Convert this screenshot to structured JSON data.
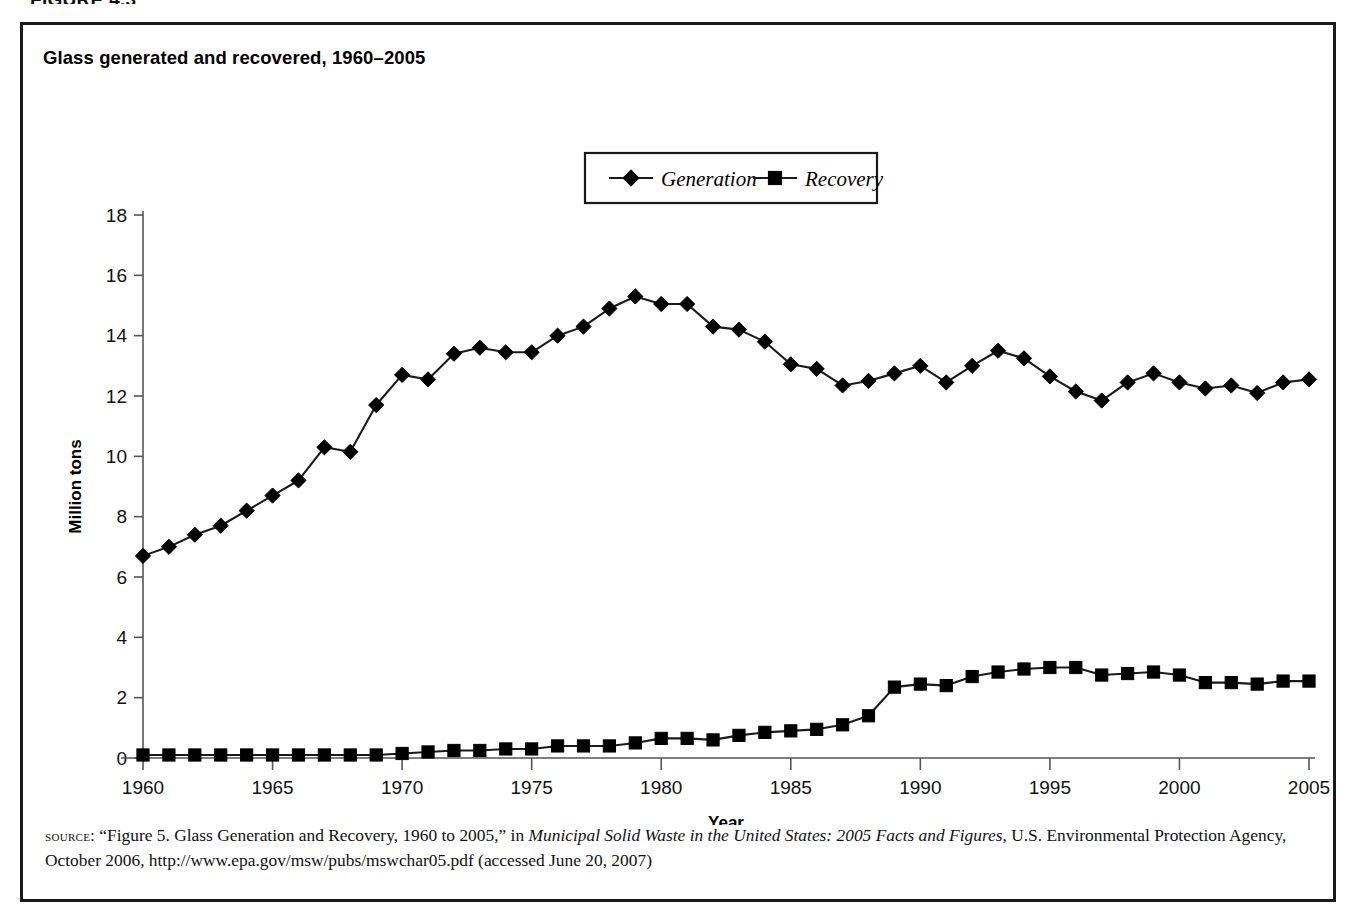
{
  "figure_number": "FIGURE 4.3",
  "chart_title": "Glass generated and recovered, 1960–2005",
  "legend": {
    "items": [
      {
        "label": "Generation",
        "marker": "diamond"
      },
      {
        "label": "Recovery",
        "marker": "square"
      }
    ]
  },
  "axes": {
    "x_title": "Year",
    "y_title": "Million tons",
    "x_ticks": [
      "1960",
      "1965",
      "1970",
      "1975",
      "1980",
      "1985",
      "1990",
      "1995",
      "2000",
      "2005"
    ],
    "y_ticks": [
      "0",
      "2",
      "4",
      "6",
      "8",
      "10",
      "12",
      "14",
      "16",
      "18"
    ]
  },
  "source": {
    "label": "source:",
    "text_part1": " “Figure 5. Glass Generation and Recovery, 1960 to 2005,” in ",
    "italic_part": "Municipal Solid Waste in the United States: 2005 Facts and Figures",
    "text_part2": ", U.S. Environmental Protection Agency, October 2006, http://www.epa.gov/msw/pubs/mswchar05.pdf (accessed June 20, 2007)"
  },
  "colors": {
    "line": "#1a1a1a",
    "marker": "#000000",
    "frame": "#1a1a1a",
    "axis": "#555555"
  },
  "chart_data": {
    "type": "line",
    "title": "Glass generated and recovered, 1960–2005",
    "xlabel": "Year",
    "ylabel": "Million tons",
    "xlim": [
      1960,
      2005
    ],
    "ylim": [
      0,
      18
    ],
    "grid": false,
    "legend_position": "top-center",
    "x": [
      1960,
      1961,
      1962,
      1963,
      1964,
      1965,
      1966,
      1967,
      1968,
      1969,
      1970,
      1971,
      1972,
      1973,
      1974,
      1975,
      1976,
      1977,
      1978,
      1979,
      1980,
      1981,
      1982,
      1983,
      1984,
      1985,
      1986,
      1987,
      1988,
      1989,
      1990,
      1991,
      1992,
      1993,
      1994,
      1995,
      1996,
      1997,
      1998,
      1999,
      2000,
      2001,
      2002,
      2003,
      2004,
      2005
    ],
    "series": [
      {
        "name": "Generation",
        "marker": "diamond",
        "values": [
          6.7,
          7.0,
          7.4,
          7.7,
          8.2,
          8.7,
          9.2,
          10.3,
          10.15,
          11.7,
          12.7,
          12.55,
          13.4,
          13.6,
          13.45,
          13.45,
          14.0,
          14.3,
          14.9,
          15.3,
          15.05,
          15.05,
          14.3,
          14.2,
          13.8,
          13.05,
          12.9,
          12.35,
          12.5,
          12.75,
          13.0,
          12.45,
          13.0,
          13.5,
          13.25,
          12.65,
          12.15,
          11.85,
          12.45,
          12.75,
          12.45,
          12.25,
          12.35,
          12.1,
          12.45,
          12.55
        ]
      },
      {
        "name": "Recovery",
        "marker": "square",
        "values": [
          0.1,
          0.1,
          0.1,
          0.1,
          0.1,
          0.1,
          0.1,
          0.1,
          0.1,
          0.1,
          0.15,
          0.2,
          0.25,
          0.25,
          0.3,
          0.3,
          0.4,
          0.4,
          0.4,
          0.5,
          0.65,
          0.65,
          0.6,
          0.75,
          0.85,
          0.9,
          0.95,
          1.1,
          1.4,
          2.35,
          2.45,
          2.4,
          2.7,
          2.85,
          2.95,
          3.0,
          3.0,
          2.75,
          2.8,
          2.85,
          2.75,
          2.5,
          2.5,
          2.45,
          2.55,
          2.55
        ]
      }
    ]
  }
}
